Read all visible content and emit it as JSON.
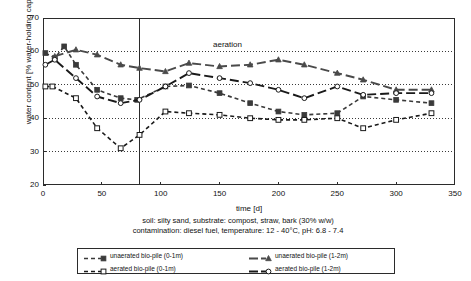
{
  "chart_data": {
    "type": "line",
    "title": "",
    "xlabel": "time [d]",
    "ylabel": "water content [% water-holding capacity]",
    "xlim": [
      0,
      350
    ],
    "ylim": [
      20,
      70
    ],
    "xticks": [
      0,
      50,
      100,
      150,
      200,
      250,
      300,
      350
    ],
    "yticks": [
      20,
      30,
      40,
      50,
      60,
      70
    ],
    "grid": "horizontal dotted gridlines at 30, 40, 50, 60",
    "legend_position": "below plot, two columns, boxed",
    "annotations": [
      {
        "text": "aeration",
        "x": 82,
        "type": "vertical-line-label",
        "note": "solid vertical line at x = 82 d marking start of aeration"
      }
    ],
    "caption_lines": [
      "soil: silty sand, substrate: compost, straw, bark (30% w/w)",
      "contamination: diesel fuel, temperature: 12 - 40°C, pH: 6.8 - 7.4"
    ],
    "series": [
      {
        "name": "unaerated bio-pile (0-1m)",
        "marker": "filled-square",
        "line": "short-dash",
        "color": "#3a3a3a",
        "x": [
          2,
          10,
          18,
          28,
          46,
          66,
          80,
          104,
          124,
          150,
          176,
          200,
          222,
          250,
          272,
          300,
          330
        ],
        "y": [
          59.5,
          58.0,
          61.5,
          56.0,
          48.5,
          46.0,
          45.5,
          49.5,
          49.8,
          47.5,
          44.5,
          42.0,
          41.0,
          41.5,
          46.5,
          45.5,
          44.5
        ]
      },
      {
        "name": "aerated bio-pile (0-1m)",
        "marker": "open-square",
        "line": "short-dash",
        "color": "#1a1a1a",
        "x": [
          2,
          8,
          28,
          46,
          66,
          82,
          104,
          124,
          150,
          176,
          200,
          222,
          250,
          272,
          300,
          330
        ],
        "y": [
          49.5,
          49.5,
          46.0,
          37.0,
          31.0,
          35.0,
          42.0,
          41.5,
          41.0,
          40.0,
          39.5,
          39.5,
          40.0,
          37.0,
          39.5,
          41.5
        ]
      },
      {
        "name": "unaerated bio-pile (1-2m)",
        "marker": "filled-triangle",
        "line": "long-dash",
        "color": "#4a4a4a",
        "x": [
          10,
          28,
          46,
          66,
          82,
          104,
          124,
          150,
          176,
          200,
          222,
          250,
          272,
          300,
          330
        ],
        "y": [
          58.5,
          60.5,
          59.0,
          56.0,
          55.0,
          54.0,
          56.5,
          55.5,
          56.0,
          57.5,
          56.0,
          53.5,
          51.5,
          48.5,
          48.5
        ]
      },
      {
        "name": "aerated bio-pile (1-2m)",
        "marker": "open-circle",
        "line": "long-dash",
        "color": "#1a1a1a",
        "x": [
          2,
          10,
          28,
          46,
          66,
          82,
          104,
          124,
          150,
          176,
          200,
          222,
          250,
          272,
          300,
          330
        ],
        "y": [
          56.0,
          57.5,
          52.0,
          46.5,
          44.5,
          45.5,
          49.5,
          53.5,
          52.0,
          50.5,
          48.5,
          46.0,
          49.5,
          47.0,
          47.5,
          47.5
        ]
      }
    ]
  },
  "axes": {
    "x_title": "time [d]",
    "y_title": "water content [% water-holding capacity]",
    "x_tick_labels": [
      "0",
      "50",
      "100",
      "150",
      "200",
      "250",
      "300",
      "350"
    ],
    "y_tick_labels": [
      "20",
      "30",
      "40",
      "50",
      "60",
      "70"
    ]
  },
  "annotation": {
    "aeration": "aeration"
  },
  "caption": {
    "line1": "soil: silty sand, substrate: compost, straw, bark (30% w/w)",
    "line2": "contamination: diesel fuel, temperature: 12 - 40°C, pH: 6.8 - 7.4"
  },
  "legend": {
    "items": [
      {
        "label": "unaerated bio-pile (0-1m)"
      },
      {
        "label": "aerated bio-pile (0-1m)"
      },
      {
        "label": "unaerated bio-pile (1-2m)"
      },
      {
        "label": "aerated bio-pile (1-2m)"
      }
    ]
  },
  "colors": {
    "frame": "#2b2b2b",
    "gridline": "#3a3a3a",
    "series_unaerated_0_1": "#3a3a3a",
    "series_aerated_0_1": "#1a1a1a",
    "series_unaerated_1_2": "#4a4a4a",
    "series_aerated_1_2": "#1a1a1a"
  }
}
